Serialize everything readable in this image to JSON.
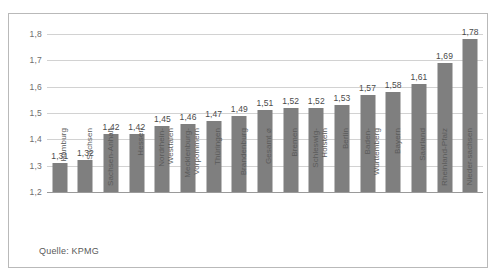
{
  "top_clipped_text": "",
  "source_note": "Quelle: KPMG",
  "chart_data": {
    "type": "bar",
    "title": "",
    "subtitle": "",
    "xlabel": "",
    "ylabel": "",
    "ylim": [
      1.2,
      1.8
    ],
    "ytick_labels": [
      "1,2",
      "1,3",
      "1,4",
      "1,5",
      "1,6",
      "1,7",
      "1,8"
    ],
    "ytick_values": [
      1.2,
      1.3,
      1.4,
      1.5,
      1.6,
      1.7,
      1.8
    ],
    "grid": true,
    "legend": "none",
    "bar_color": "#7f7f7f",
    "gridline_color": "#d2d2d2",
    "axis_color": "#9a9a9a",
    "categories": [
      "Hamburg",
      "Sachsen",
      "Sachsen-Anhalt",
      "Hessen",
      "Nordrhein-Westfalen",
      "Mecklenburg-Vorpommern",
      "Thüringen",
      "Brandenburg",
      "Gesamt ⌀",
      "Bremen",
      "Schleswig-Holstein",
      "Berlin",
      "Baden-Württemberg",
      "Bayern",
      "Saarland",
      "Rheinland-Pfalz",
      "Niedersachsen"
    ],
    "category_lines": [
      [
        "Hamburg"
      ],
      [
        "Sachsen"
      ],
      [
        "Sachsen-",
        "Anhalt"
      ],
      [
        "Hessen"
      ],
      [
        "Nordrhein-",
        "Westfalen"
      ],
      [
        "Mecklenburg-",
        "Vorpommern"
      ],
      [
        "Thüringen"
      ],
      [
        "Brandenburg"
      ],
      [
        "Gesamt ⌀"
      ],
      [
        "Bremen"
      ],
      [
        "Schleswig-",
        "Holstein"
      ],
      [
        "Berlin"
      ],
      [
        "Baden-",
        "Württemberg"
      ],
      [
        "Bayern"
      ],
      [
        "Saarland"
      ],
      [
        "Rheinland-",
        "Pfalz"
      ],
      [
        "Nieder-",
        "sachsen"
      ]
    ],
    "values": [
      1.31,
      1.32,
      1.42,
      1.42,
      1.45,
      1.46,
      1.47,
      1.49,
      1.51,
      1.52,
      1.52,
      1.53,
      1.57,
      1.58,
      1.61,
      1.69,
      1.78
    ],
    "value_labels": [
      "1,31",
      "1,32",
      "1,42",
      "1,42",
      "1,45",
      "1,46",
      "1,47",
      "1,49",
      "1,51",
      "1,52",
      "1,52",
      "1,53",
      "1,57",
      "1,58",
      "1,61",
      "1,69",
      "1,78"
    ]
  }
}
